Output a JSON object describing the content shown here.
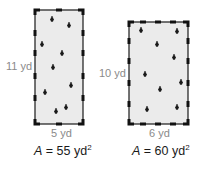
{
  "figure": {
    "colors": {
      "fill": "#ebebeb",
      "border": "#1a1a1a",
      "tick": "#111111",
      "leaf": "#1a1a1a",
      "dimension_text": "#8a8a8a",
      "area_text": "#1a1a1a"
    },
    "rectangles": [
      {
        "id": "left",
        "height_label": "11 yd",
        "width_label": "5 yd",
        "area_var": "A",
        "area_eq": " = 55 yd",
        "area_exp": "2",
        "box": {
          "x": 35,
          "y": 10,
          "w": 48,
          "h": 114
        }
      },
      {
        "id": "right",
        "height_label": "10 yd",
        "width_label": "6 yd",
        "area_var": "A",
        "area_eq": " = 60 yd",
        "area_exp": "2",
        "box": {
          "x": 129,
          "y": 22,
          "w": 59,
          "h": 102
        }
      }
    ]
  }
}
